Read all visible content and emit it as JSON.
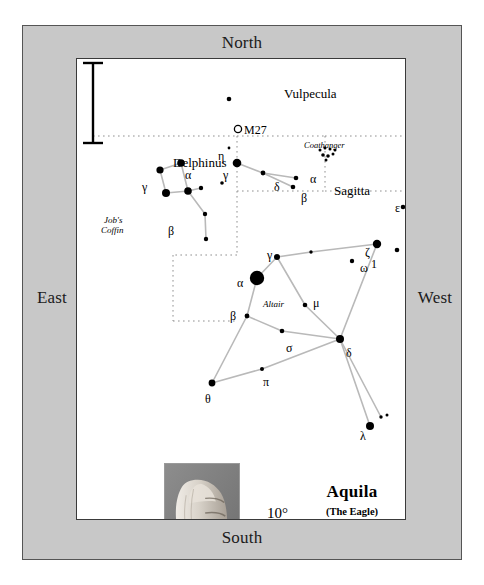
{
  "compass": {
    "north": "North",
    "south": "South",
    "east": "East",
    "west": "West"
  },
  "title": {
    "main": "Aquila",
    "sub": "(The Eagle)"
  },
  "scale": {
    "label": "10°",
    "hand_icon": "fist-hand-photo"
  },
  "constellation_labels": [
    {
      "name": "Delphinus",
      "x": 96,
      "y": 97,
      "style": "conname"
    },
    {
      "name": "Vulpecula",
      "x": 207,
      "y": 28,
      "style": "conname"
    },
    {
      "name": "Sagitta",
      "x": 257,
      "y": 125,
      "style": "conname"
    }
  ],
  "asterism_labels": [
    {
      "name": "Job's",
      "x": 27,
      "y": 157,
      "style": "ital"
    },
    {
      "name": "Coffin",
      "x": 24,
      "y": 167,
      "style": "ital"
    },
    {
      "name": "Coathanger",
      "x": 227,
      "y": 82,
      "style": "ital2"
    },
    {
      "name": "Altair",
      "x": 186,
      "y": 241,
      "style": "ital"
    }
  ],
  "deepsky": [
    {
      "name": "M27",
      "x": 161,
      "y": 70,
      "marker": "open-circle"
    }
  ],
  "star_labels": [
    {
      "g": "α",
      "x": 108,
      "y": 110
    },
    {
      "g": "γ",
      "x": 65,
      "y": 122
    },
    {
      "g": "β",
      "x": 91,
      "y": 166
    },
    {
      "g": "η",
      "x": 141,
      "y": 91
    },
    {
      "g": "γ",
      "x": 146,
      "y": 110
    },
    {
      "g": "δ",
      "x": 197,
      "y": 122
    },
    {
      "g": "α",
      "x": 233,
      "y": 114
    },
    {
      "g": "β",
      "x": 224,
      "y": 133
    },
    {
      "g": "ε",
      "x": 318,
      "y": 143
    },
    {
      "g": "ζ",
      "x": 288,
      "y": 187
    },
    {
      "g": "ω",
      "x": 283,
      "y": 203
    },
    {
      "g": "1",
      "x": 294,
      "y": 199
    },
    {
      "g": "γ",
      "x": 190,
      "y": 190
    },
    {
      "g": "α",
      "x": 160,
      "y": 218
    },
    {
      "g": "μ",
      "x": 236,
      "y": 238
    },
    {
      "g": "β",
      "x": 153,
      "y": 251
    },
    {
      "g": "σ",
      "x": 209,
      "y": 283
    },
    {
      "g": "δ",
      "x": 269,
      "y": 288
    },
    {
      "g": "π",
      "x": 186,
      "y": 317
    },
    {
      "g": "θ",
      "x": 128,
      "y": 334
    },
    {
      "g": "λ",
      "x": 283,
      "y": 371
    }
  ],
  "stars": [
    {
      "x": 83,
      "y": 111,
      "r": 3.6
    },
    {
      "x": 104,
      "y": 104,
      "r": 3.8
    },
    {
      "x": 89,
      "y": 134,
      "r": 4.0
    },
    {
      "x": 111,
      "y": 132,
      "r": 3.8
    },
    {
      "x": 124,
      "y": 129,
      "r": 2.2
    },
    {
      "x": 128,
      "y": 155,
      "r": 2.2
    },
    {
      "x": 129,
      "y": 180,
      "r": 2.2
    },
    {
      "x": 152,
      "y": 40,
      "r": 2.3
    },
    {
      "x": 152,
      "y": 89,
      "r": 1.4
    },
    {
      "x": 160,
      "y": 104,
      "r": 4.3
    },
    {
      "x": 186,
      "y": 114,
      "r": 2.4
    },
    {
      "x": 145,
      "y": 124,
      "r": 1.8
    },
    {
      "x": 219,
      "y": 119,
      "r": 2.3
    },
    {
      "x": 216,
      "y": 128,
      "r": 2.3
    },
    {
      "x": 243,
      "y": 91,
      "r": 1.5
    },
    {
      "x": 248,
      "y": 89,
      "r": 1.5
    },
    {
      "x": 253,
      "y": 90,
      "r": 1.5
    },
    {
      "x": 258,
      "y": 91,
      "r": 1.5
    },
    {
      "x": 246,
      "y": 96,
      "r": 1.8
    },
    {
      "x": 251,
      "y": 97,
      "r": 1.8
    },
    {
      "x": 256,
      "y": 95,
      "r": 1.5
    },
    {
      "x": 249,
      "y": 101,
      "r": 1.5
    },
    {
      "x": 326,
      "y": 148,
      "r": 2.3
    },
    {
      "x": 300,
      "y": 185,
      "r": 4.2
    },
    {
      "x": 320,
      "y": 191,
      "r": 2.3
    },
    {
      "x": 275,
      "y": 202,
      "r": 2.2
    },
    {
      "x": 234,
      "y": 193,
      "r": 1.7
    },
    {
      "x": 200,
      "y": 198,
      "r": 3.0
    },
    {
      "x": 180,
      "y": 219,
      "r": 7.2
    },
    {
      "x": 228,
      "y": 246,
      "r": 2.3
    },
    {
      "x": 170,
      "y": 257,
      "r": 2.4
    },
    {
      "x": 205,
      "y": 272,
      "r": 2.3
    },
    {
      "x": 263,
      "y": 280,
      "r": 4.0
    },
    {
      "x": 185,
      "y": 310,
      "r": 2.0
    },
    {
      "x": 135,
      "y": 324,
      "r": 3.4
    },
    {
      "x": 293,
      "y": 367,
      "r": 4.0
    },
    {
      "x": 304,
      "y": 358,
      "r": 1.7
    },
    {
      "x": 310,
      "y": 356,
      "r": 1.5
    }
  ],
  "constellation_lines": [
    [
      83,
      111,
      104,
      104
    ],
    [
      104,
      104,
      111,
      132
    ],
    [
      111,
      132,
      89,
      134
    ],
    [
      89,
      134,
      83,
      111
    ],
    [
      111,
      132,
      124,
      129
    ],
    [
      111,
      132,
      128,
      155
    ],
    [
      128,
      155,
      129,
      180
    ],
    [
      160,
      104,
      186,
      114
    ],
    [
      186,
      114,
      219,
      119
    ],
    [
      186,
      114,
      216,
      128
    ],
    [
      200,
      198,
      180,
      219
    ],
    [
      200,
      198,
      234,
      193
    ],
    [
      234,
      193,
      300,
      185
    ],
    [
      200,
      198,
      228,
      246
    ],
    [
      228,
      246,
      263,
      280
    ],
    [
      180,
      219,
      170,
      257
    ],
    [
      170,
      257,
      205,
      272
    ],
    [
      205,
      272,
      263,
      280
    ],
    [
      170,
      257,
      135,
      324
    ],
    [
      135,
      324,
      185,
      310
    ],
    [
      185,
      310,
      263,
      280
    ],
    [
      300,
      185,
      263,
      280
    ],
    [
      263,
      280,
      293,
      367
    ],
    [
      263,
      280,
      304,
      358
    ]
  ],
  "boundaries": [
    [
      16,
      77,
      160,
      77
    ],
    [
      160,
      77,
      160,
      132
    ],
    [
      160,
      77,
      248,
      77
    ],
    [
      248,
      77,
      248,
      132
    ],
    [
      248,
      77,
      330,
      77
    ],
    [
      330,
      77,
      330,
      74
    ],
    [
      160,
      132,
      248,
      132
    ],
    [
      248,
      132,
      330,
      132
    ],
    [
      160,
      132,
      160,
      196
    ],
    [
      160,
      196,
      96,
      196
    ],
    [
      96,
      196,
      96,
      262
    ],
    [
      96,
      262,
      160,
      262
    ],
    [
      330,
      74,
      330,
      132
    ]
  ]
}
